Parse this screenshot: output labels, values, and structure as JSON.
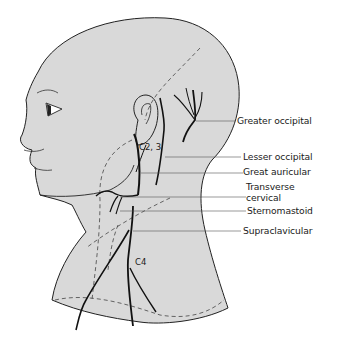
{
  "figure": {
    "colors": {
      "background": "#ffffff",
      "skin": "#d9d9d9",
      "outline": "#222222",
      "nerve": "#111111",
      "leader_line": "#555555"
    },
    "labels": [
      {
        "id": "greater-occipital",
        "text": "Greater occipital"
      },
      {
        "id": "lesser-occipital",
        "text": "Lesser occipital"
      },
      {
        "id": "great-auricular",
        "text": "Great auricular"
      },
      {
        "id": "transverse-cervical-1",
        "text": "Transverse"
      },
      {
        "id": "transverse-cervical-2",
        "text": "cervical"
      },
      {
        "id": "sternomastoid",
        "text": "Sternomastoid"
      },
      {
        "id": "supraclavicular",
        "text": "Supraclavicular"
      }
    ],
    "inline_labels": {
      "c2_3": "C2, 3",
      "c4": "C4"
    }
  }
}
